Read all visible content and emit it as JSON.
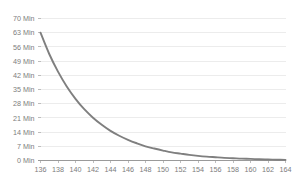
{
  "chart_data": {
    "type": "line",
    "title": "",
    "subtitle": "",
    "xlabel": "",
    "ylabel": "",
    "xlim": [
      136,
      164
    ],
    "ylim": [
      0,
      70
    ],
    "grid": true,
    "legend": false,
    "legend_position": "none",
    "x_tick_labels": [
      "136",
      "138",
      "140",
      "142",
      "144",
      "146",
      "148",
      "150",
      "152",
      "154",
      "156",
      "158",
      "160",
      "162",
      "164"
    ],
    "x_ticks": [
      136,
      138,
      140,
      142,
      144,
      146,
      148,
      150,
      152,
      154,
      156,
      158,
      160,
      162,
      164
    ],
    "y_tick_labels": [
      "0 Min",
      "7 Min",
      "14 Min",
      "21 Min",
      "28 Min",
      "35 Min",
      "42 Min",
      "49 Min",
      "56 Min",
      "63 Min",
      "70 Min"
    ],
    "y_ticks": [
      0,
      7,
      14,
      21,
      28,
      35,
      42,
      49,
      56,
      63,
      70
    ],
    "series": [
      {
        "name": "decay",
        "color": "#7f7f7f",
        "x": [
          136,
          137,
          138,
          139,
          140,
          141,
          142,
          143,
          144,
          145,
          146,
          147,
          148,
          149,
          150,
          151,
          152,
          153,
          154,
          155,
          156,
          157,
          158,
          159,
          160,
          161,
          162,
          163,
          164
        ],
        "values": [
          63.0,
          52.5,
          43.8,
          36.5,
          30.4,
          25.3,
          21.1,
          17.6,
          14.6,
          12.2,
          10.2,
          8.5,
          7.0,
          5.9,
          4.9,
          4.0,
          3.4,
          2.8,
          2.3,
          1.9,
          1.6,
          1.3,
          1.1,
          0.9,
          0.8,
          0.6,
          0.5,
          0.4,
          0.3
        ]
      }
    ]
  }
}
